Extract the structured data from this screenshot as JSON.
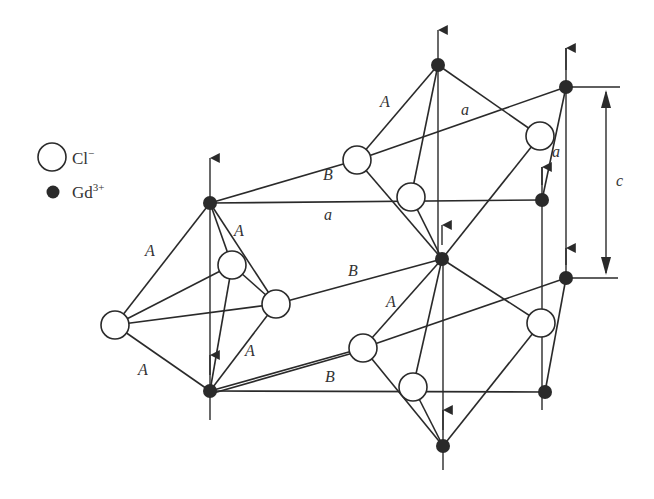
{
  "legend": {
    "chloride": {
      "symbol": "Cl",
      "charge": "−",
      "marker": "open-circle"
    },
    "gadolinium": {
      "symbol": "Gd",
      "charge": "3+",
      "marker": "filled-circle"
    }
  },
  "labels": {
    "A": "A",
    "B": "B",
    "a": "a",
    "c": "c"
  },
  "colors": {
    "line": "#2a2a2a",
    "background": "#ffffff"
  }
}
